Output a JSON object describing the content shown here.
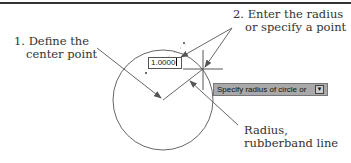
{
  "diagram": {
    "labels": {
      "step1_line1": "1. Define the",
      "step1_line2": "center point",
      "step2_line1": "2. Enter the radius",
      "step2_line2": "or specify a point",
      "radius_line1": "Radius,",
      "radius_line2": "rubberband line"
    },
    "input_value": "1.0000",
    "tooltip_text": "Specify radius of circle or",
    "tooltip_icon": "down-arrow-icon",
    "colors": {
      "line": "#555555",
      "tooltip_bg": "#a9a9a9",
      "text": "#333333"
    }
  }
}
